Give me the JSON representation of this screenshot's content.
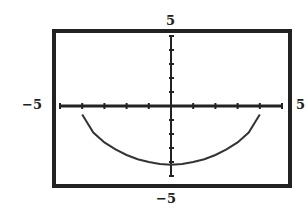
{
  "chart_data": {
    "type": "line",
    "title": "",
    "xlabel": "",
    "ylabel": "",
    "xlim": [
      -5,
      5
    ],
    "ylim": [
      -5,
      5
    ],
    "x_tick_step": 1,
    "y_tick_step": 1,
    "window_labels": {
      "ymax": "5",
      "ymin": "−5",
      "xmin": "−5",
      "xmax": "5"
    },
    "grid": false,
    "series": [
      {
        "name": "curve",
        "x": [
          -4,
          -3.5,
          -3,
          -2.5,
          -2,
          -1.5,
          -1,
          -0.5,
          0,
          0.5,
          1,
          1.5,
          2,
          2.5,
          3,
          3.5,
          4
        ],
        "y": [
          -0.6,
          -1.9,
          -2.6,
          -3.1,
          -3.5,
          -3.8,
          -4.0,
          -4.15,
          -4.2,
          -4.15,
          -4.0,
          -3.8,
          -3.5,
          -3.1,
          -2.6,
          -1.9,
          -0.6
        ]
      }
    ]
  },
  "labels": {
    "top": "5",
    "bottom": "−5",
    "left": "−5",
    "right": "5"
  }
}
